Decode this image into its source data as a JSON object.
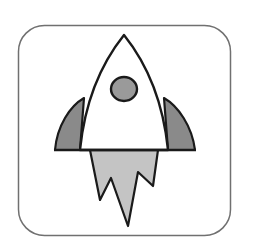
{
  "icon": {
    "name": "rocket-app-icon",
    "colors": {
      "background": "#ffffff",
      "frame_stroke": "#707070",
      "outline": "#1a1a1a",
      "body_fill": "#ffffff",
      "fin_fill": "#8a8a8a",
      "window_fill": "#9a9a9a",
      "flame_fill": "#c4c4c4"
    }
  }
}
